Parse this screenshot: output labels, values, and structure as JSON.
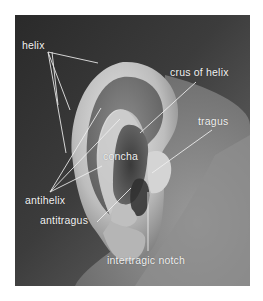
{
  "figure": {
    "colors": {
      "page_background": "#ffffff",
      "photo_dark": "#2e2e2e",
      "photo_skin_mid": "#8a8a8a",
      "photo_skin_light": "#d8d8d8",
      "label_text": "#f2f2f2",
      "leader_line": "#f0f0f0"
    },
    "labels": [
      {
        "id": "helix",
        "text": "helix",
        "x": 22,
        "y": 40
      },
      {
        "id": "crus-of-helix",
        "text": "crus of helix",
        "x": 170,
        "y": 67
      },
      {
        "id": "tragus",
        "text": "tragus",
        "x": 198,
        "y": 116
      },
      {
        "id": "concha",
        "text": "concha",
        "x": 103,
        "y": 151
      },
      {
        "id": "antihelix",
        "text": "antihelix",
        "x": 25,
        "y": 195
      },
      {
        "id": "antitragus",
        "text": "antitragus",
        "x": 40,
        "y": 215
      },
      {
        "id": "intertragic-notch",
        "text": "intertragic notch",
        "x": 107,
        "y": 255
      }
    ]
  }
}
